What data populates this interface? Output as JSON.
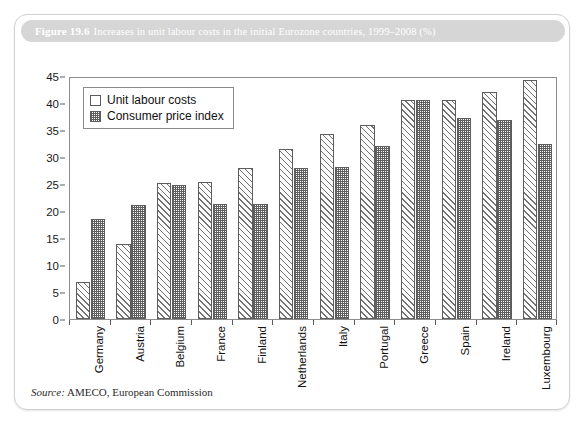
{
  "figure": {
    "number_label": "Figure 19.6",
    "caption": "Increases in unit labour costs in the initial Eurozone countries, 1999–2008 (%)",
    "source_label": "Source:",
    "source_text": "AMECO, European Commission"
  },
  "chart_data": {
    "type": "bar",
    "title": "Increases in unit labour costs in the initial Eurozone countries, 1999–2008 (%)",
    "xlabel": "",
    "ylabel": "",
    "ylim": [
      0,
      45
    ],
    "ytick_step": 5,
    "yticks": [
      0,
      5,
      10,
      15,
      20,
      25,
      30,
      35,
      40,
      45
    ],
    "grid": false,
    "legend_position": "upper-left",
    "categories": [
      "Germany",
      "Austria",
      "Belgium",
      "France",
      "Finland",
      "Netherlands",
      "Italy",
      "Portugal",
      "Greece",
      "Spain",
      "Ireland",
      "Luxembourg"
    ],
    "series": [
      {
        "name": "Unit labour costs",
        "pattern": "diagonal-hatch",
        "values": [
          6.8,
          13.8,
          25.1,
          25.4,
          28.0,
          31.5,
          34.2,
          35.9,
          40.6,
          40.5,
          42.1,
          44.2
        ]
      },
      {
        "name": "Consumer price index",
        "pattern": "checker-fill",
        "values": [
          18.5,
          21.1,
          24.9,
          21.3,
          21.3,
          28.0,
          28.2,
          32.1,
          40.6,
          37.2,
          36.9,
          32.5
        ]
      }
    ]
  }
}
